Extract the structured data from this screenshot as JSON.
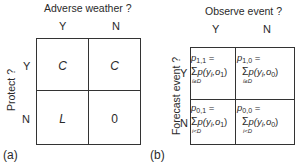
{
  "panel_a": {
    "tag": "(a)",
    "column_title": "Adverse weather ?",
    "row_title": "Protect ?",
    "columns": [
      "Y",
      "N"
    ],
    "rows": [
      "Y",
      "N"
    ],
    "cells": [
      [
        "C",
        "C"
      ],
      [
        "L",
        "0"
      ]
    ]
  },
  "panel_b": {
    "tag": "(b)",
    "column_title": "Observe event ?",
    "row_title": "Forecast event ?",
    "columns": [
      "Y",
      "N"
    ],
    "rows": [
      "Y",
      "N"
    ],
    "cells": [
      [
        {
          "lhs": "p",
          "sub": "1,1",
          "eq": "=",
          "sum": "Σ",
          "sum_under": "i≥D",
          "term": "p(y",
          "term_i": "i",
          "term_o": ",o",
          "term_o_sub": "1",
          "close": ")"
        },
        {
          "lhs": "p",
          "sub": "1,0",
          "eq": "=",
          "sum": "Σ",
          "sum_under": "i≥D",
          "term": "p(y",
          "term_i": "i",
          "term_o": ",o",
          "term_o_sub": "0",
          "close": ")"
        }
      ],
      [
        {
          "lhs": "p",
          "sub": "0,1",
          "eq": "=",
          "sum": "Σ",
          "sum_under": "i<D",
          "term": "p(y",
          "term_i": "i",
          "term_o": ",o",
          "term_o_sub": "1",
          "close": ")"
        },
        {
          "lhs": "p",
          "sub": "0,0",
          "eq": "=",
          "sum": "Σ",
          "sum_under": "i<D",
          "term": "p(y",
          "term_i": "i",
          "term_o": ",o",
          "term_o_sub": "0",
          "close": ")"
        }
      ]
    ]
  }
}
